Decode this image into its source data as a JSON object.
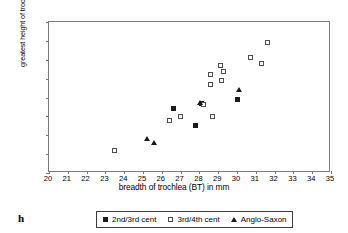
{
  "figure": {
    "letter": "h"
  },
  "chart_data": {
    "type": "scatter",
    "title": "",
    "xlabel": "breadth of trochlea (BT) in mm",
    "ylabel": "greatest height of trochlea (GHT) in m",
    "xlim": [
      20,
      35
    ],
    "ylim": [
      14,
      22
    ],
    "xticks": [
      20,
      21,
      22,
      23,
      24,
      25,
      26,
      27,
      28,
      29,
      30,
      31,
      32,
      33,
      34,
      35
    ],
    "yticks": [
      14,
      15,
      16,
      17,
      18,
      19,
      20,
      21,
      22
    ],
    "grid": false,
    "legend_position": "bottom",
    "series": [
      {
        "name": "2nd/3rd cent",
        "marker": "filled-square",
        "color": "#1a1a1a",
        "points": [
          [
            26.6,
            17.4
          ],
          [
            27.8,
            16.5
          ],
          [
            28.1,
            17.7
          ],
          [
            30.0,
            17.9
          ]
        ]
      },
      {
        "name": "3rd/4th cent",
        "marker": "open-square",
        "color": "#4d4d4d",
        "points": [
          [
            23.5,
            15.2
          ],
          [
            26.4,
            16.8
          ],
          [
            27.0,
            17.0
          ],
          [
            28.2,
            17.65
          ],
          [
            28.6,
            18.7
          ],
          [
            28.6,
            19.2
          ],
          [
            28.7,
            17.0
          ],
          [
            29.1,
            19.7
          ],
          [
            29.2,
            18.9
          ],
          [
            29.3,
            19.4
          ],
          [
            30.7,
            20.1
          ],
          [
            31.3,
            19.8
          ],
          [
            31.6,
            20.9
          ]
        ]
      },
      {
        "name": "Anglo-Saxon",
        "marker": "filled-triangle",
        "color": "#1a1a1a",
        "points": [
          [
            25.2,
            15.8
          ],
          [
            25.6,
            15.6
          ],
          [
            28.05,
            17.72
          ],
          [
            30.1,
            18.4
          ]
        ]
      }
    ]
  }
}
